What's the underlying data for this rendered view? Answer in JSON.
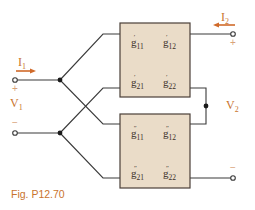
{
  "figure": {
    "caption": "Fig. P12.70",
    "colors": {
      "wire": "#3a3a3a",
      "box_fill": "#eadcc8",
      "box_stroke": "#4a3f38",
      "accent": "#d06a2a",
      "label": "#3a2f28"
    }
  },
  "port1": {
    "current_label": "I",
    "current_sub": "1",
    "voltage_label": "V",
    "voltage_sub": "1",
    "plus": "+",
    "minus": "−"
  },
  "port2": {
    "current_label": "I",
    "current_sub": "2",
    "voltage_label": "V",
    "voltage_sub": "2",
    "plus": "+",
    "minus": "−"
  },
  "network_top": {
    "prime": "′",
    "params": [
      {
        "base": "g",
        "sub": "11"
      },
      {
        "base": "g",
        "sub": "12"
      },
      {
        "base": "g",
        "sub": "21"
      },
      {
        "base": "g",
        "sub": "22"
      }
    ]
  },
  "network_bottom": {
    "prime": "″",
    "params": [
      {
        "base": "g",
        "sub": "11"
      },
      {
        "base": "g",
        "sub": "12"
      },
      {
        "base": "g",
        "sub": "21"
      },
      {
        "base": "g",
        "sub": "22"
      }
    ]
  }
}
